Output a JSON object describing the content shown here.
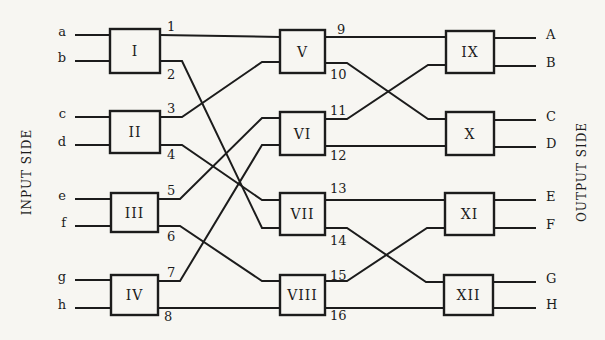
{
  "diagram": {
    "type": "three-stage switching network",
    "side_labels": {
      "input": "INPUT SIDE",
      "output": "OUTPUT SIDE"
    },
    "inputs": [
      {
        "label": "a",
        "y": 35
      },
      {
        "label": "b",
        "y": 61
      },
      {
        "label": "c",
        "y": 117
      },
      {
        "label": "d",
        "y": 145
      },
      {
        "label": "e",
        "y": 199
      },
      {
        "label": "f",
        "y": 226
      },
      {
        "label": "g",
        "y": 280
      },
      {
        "label": "h",
        "y": 308
      }
    ],
    "outputs": [
      {
        "label": "A",
        "y": 38
      },
      {
        "label": "B",
        "y": 66
      },
      {
        "label": "C",
        "y": 120
      },
      {
        "label": "D",
        "y": 147
      },
      {
        "label": "E",
        "y": 200
      },
      {
        "label": "F",
        "y": 228
      },
      {
        "label": "G",
        "y": 282
      },
      {
        "label": "H",
        "y": 308
      }
    ],
    "stages": [
      {
        "name": "stage-1",
        "boxes": [
          {
            "id": "I",
            "label": "I",
            "x": 110,
            "y": 29,
            "w": 50,
            "h": 44
          },
          {
            "id": "II",
            "label": "II",
            "x": 110,
            "y": 111,
            "w": 50,
            "h": 42
          },
          {
            "id": "III",
            "label": "III",
            "x": 111,
            "y": 193,
            "w": 47,
            "h": 39
          },
          {
            "id": "IV",
            "label": "IV",
            "x": 111,
            "y": 275,
            "w": 47,
            "h": 40
          }
        ]
      },
      {
        "name": "stage-2",
        "boxes": [
          {
            "id": "V",
            "label": "V",
            "x": 280,
            "y": 30,
            "w": 45,
            "h": 43
          },
          {
            "id": "VI",
            "label": "VI",
            "x": 280,
            "y": 112,
            "w": 45,
            "h": 43
          },
          {
            "id": "VII",
            "label": "VII",
            "x": 280,
            "y": 193,
            "w": 45,
            "h": 42
          },
          {
            "id": "VIII",
            "label": "VIII",
            "x": 280,
            "y": 275,
            "w": 45,
            "h": 40
          }
        ]
      },
      {
        "name": "stage-3",
        "boxes": [
          {
            "id": "IX",
            "label": "IX",
            "x": 446,
            "y": 31,
            "w": 48,
            "h": 42
          },
          {
            "id": "X",
            "label": "X",
            "x": 446,
            "y": 112,
            "w": 48,
            "h": 43
          },
          {
            "id": "XI",
            "label": "XI",
            "x": 445,
            "y": 193,
            "w": 49,
            "h": 42
          },
          {
            "id": "XII",
            "label": "XII",
            "x": 444,
            "y": 275,
            "w": 49,
            "h": 40
          }
        ]
      }
    ],
    "links": [
      {
        "label": "1",
        "from": "I",
        "to": "V",
        "y1": 35,
        "y2": 37,
        "lx": 167,
        "ly": 31
      },
      {
        "label": "2",
        "from": "I",
        "to": "VII",
        "y1": 61,
        "y2": 228,
        "lx": 167,
        "ly": 79
      },
      {
        "label": "3",
        "from": "II",
        "to": "V",
        "y1": 117,
        "y2": 62,
        "lx": 167,
        "ly": 113
      },
      {
        "label": "4",
        "from": "II",
        "to": "VII",
        "y1": 145,
        "y2": 200,
        "lx": 167,
        "ly": 159
      },
      {
        "label": "5",
        "from": "III",
        "to": "VI",
        "y1": 199,
        "y2": 118,
        "lx": 167,
        "ly": 195
      },
      {
        "label": "6",
        "from": "III",
        "to": "VIII",
        "y1": 226,
        "y2": 281,
        "lx": 167,
        "ly": 241
      },
      {
        "label": "7",
        "from": "IV",
        "to": "VI",
        "y1": 281,
        "y2": 145,
        "lx": 167,
        "ly": 277
      },
      {
        "label": "8",
        "from": "IV",
        "to": "VIII",
        "y1": 308,
        "y2": 308,
        "lx": 164,
        "ly": 321
      },
      {
        "label": "9",
        "from": "V",
        "to": "IX",
        "y1": 37,
        "y2": 37,
        "lx": 337,
        "ly": 34
      },
      {
        "label": "10",
        "from": "V",
        "to": "X",
        "y1": 63,
        "y2": 119,
        "lx": 330,
        "ly": 79
      },
      {
        "label": "11",
        "from": "VI",
        "to": "IX",
        "y1": 119,
        "y2": 65,
        "lx": 330,
        "ly": 115
      },
      {
        "label": "12",
        "from": "VI",
        "to": "X",
        "y1": 146,
        "y2": 146,
        "lx": 330,
        "ly": 160
      },
      {
        "label": "13",
        "from": "VII",
        "to": "XI",
        "y1": 200,
        "y2": 200,
        "lx": 330,
        "ly": 193
      },
      {
        "label": "14",
        "from": "VII",
        "to": "XII",
        "y1": 228,
        "y2": 282,
        "lx": 330,
        "ly": 245
      },
      {
        "label": "15",
        "from": "VIII",
        "to": "XI",
        "y1": 281,
        "y2": 228,
        "lx": 330,
        "ly": 280
      },
      {
        "label": "16",
        "from": "VIII",
        "to": "XII",
        "y1": 308,
        "y2": 308,
        "lx": 330,
        "ly": 320
      }
    ]
  }
}
